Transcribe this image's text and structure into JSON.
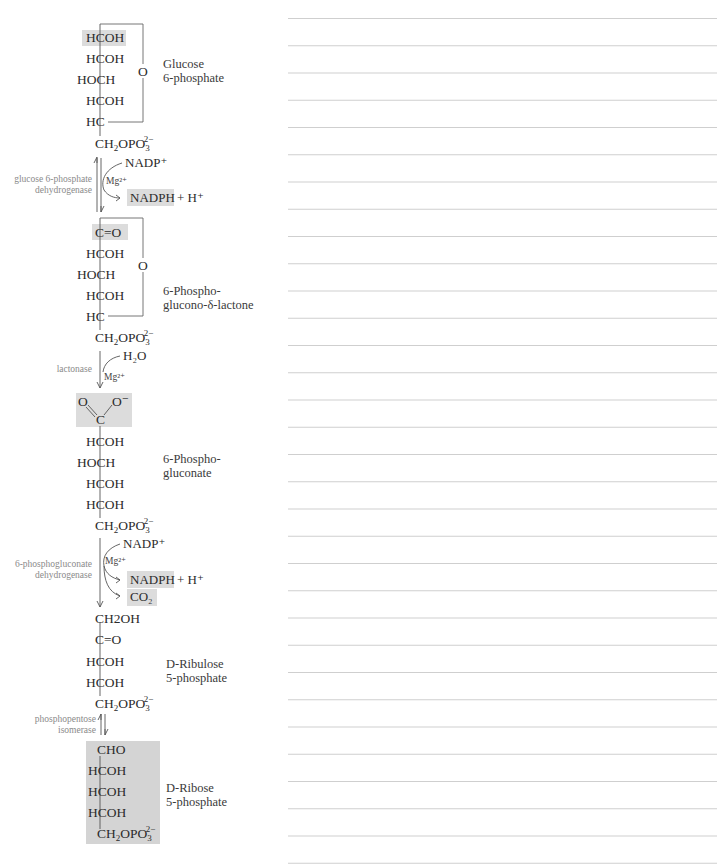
{
  "colors": {
    "highlight": "#dcdcdc",
    "ribose_box": "#d4d4d4",
    "text": "#2b2b2b",
    "enzyme_text": "#8a8a8a",
    "rule_line": "#cfcfcf"
  },
  "compounds": {
    "glucose6p": {
      "name_line1": "Glucose",
      "name_line2": "6-phosphate",
      "rows": [
        "HCOH",
        "HCOH",
        "HOCH",
        "HCOH",
        "HC"
      ],
      "ring_o": "O",
      "tail": "CH2OPO3 2−"
    },
    "lactone": {
      "name_line1": "6-Phospho-",
      "name_line2": "glucono-δ-lactone",
      "rows": [
        "C=O",
        "HCOH",
        "HOCH",
        "HCOH",
        "HC"
      ],
      "ring_o": "O"
    },
    "gluconate": {
      "name_line1": "6-Phospho-",
      "name_line2": "gluconate",
      "carboxyl_o": "O",
      "carboxyl_ominus": "O⁻",
      "carboxyl_c": "C",
      "rows": [
        "HCOH",
        "HOCH",
        "HCOH",
        "HCOH"
      ]
    },
    "ribulose5p": {
      "name_line1": "D-Ribulose",
      "name_line2": "5-phosphate",
      "rows": [
        "CH2OH",
        "C=O",
        "HCOH",
        "HCOH"
      ]
    },
    "ribose5p": {
      "name_line1": "D-Ribose",
      "name_line2": "5-phosphate",
      "rows": [
        "CHO",
        "HCOH",
        "HCOH",
        "HCOH"
      ]
    }
  },
  "steps": [
    {
      "enzyme_line1": "glucose 6-phosphate",
      "enzyme_line2": "dehydrogenase",
      "cofactor_in": "NADP⁺",
      "metal": "Mg²⁺",
      "product_hl": "NADPH",
      "product_extra": "+ H⁺",
      "reversible": true
    },
    {
      "enzyme_line1": "lactonase",
      "cofactor_in": "H₂O",
      "metal": "Mg²⁺",
      "reversible": false
    },
    {
      "enzyme_line1": "6-phosphogluconate",
      "enzyme_line2": "dehydrogenase",
      "cofactor_in": "NADP⁺",
      "metal": "Mg²⁺",
      "product_hl": "NADPH",
      "product_extra": "+ H⁺",
      "product_hl2": "CO₂",
      "reversible": false
    },
    {
      "enzyme_line1": "phosphopentose",
      "enzyme_line2": "isomerase",
      "reversible": true
    }
  ],
  "phosphate": {
    "main": "CH",
    "sub2": "2",
    "mid": "OPO",
    "sub3": "3",
    "charge": "2−"
  },
  "notes": {
    "line_count": 32
  }
}
